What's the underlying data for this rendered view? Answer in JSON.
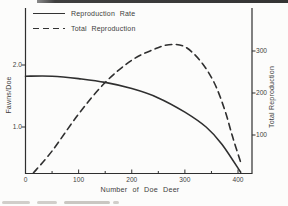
{
  "figure": {
    "ink_color": "#2f2f2f",
    "paper_color": "#fcfcfb"
  },
  "chart_data": {
    "type": "line",
    "title": "",
    "xlabel": "Number of Doe Deer",
    "x_ticks": [
      0,
      100,
      200,
      300,
      400
    ],
    "x_minor_ticks": [
      50,
      150,
      250,
      350
    ],
    "x_range": [
      0,
      427
    ],
    "grid": "off",
    "axes": {
      "left": {
        "label": "Fawns/Doe",
        "tick_labels": [
          "2.0",
          "1.0"
        ],
        "tick_values": [
          2.0,
          1.0
        ]
      },
      "right": {
        "label": "Total Reproduction",
        "tick_labels": [
          "300",
          "200",
          "100"
        ],
        "tick_values": [
          300,
          200,
          100
        ]
      }
    },
    "series": [
      {
        "name": "Reproduction Rate",
        "axis": "left",
        "line_style": "solid",
        "points": [
          [
            0,
            1.82
          ],
          [
            50,
            1.82
          ],
          [
            100,
            1.78
          ],
          [
            150,
            1.72
          ],
          [
            200,
            1.62
          ],
          [
            250,
            1.47
          ],
          [
            300,
            1.24
          ],
          [
            340,
            1.0
          ],
          [
            370,
            0.72
          ],
          [
            405,
            0.27
          ]
        ]
      },
      {
        "name": "Total Reproduction",
        "axis": "right",
        "line_style": "dashed",
        "points": [
          [
            15,
            10
          ],
          [
            50,
            62
          ],
          [
            100,
            150
          ],
          [
            150,
            225
          ],
          [
            200,
            278
          ],
          [
            240,
            303
          ],
          [
            270,
            315
          ],
          [
            300,
            310
          ],
          [
            330,
            275
          ],
          [
            355,
            225
          ],
          [
            375,
            160
          ],
          [
            390,
            95
          ],
          [
            405,
            35
          ]
        ]
      }
    ],
    "legend": {
      "position": "top-left",
      "entries": [
        {
          "label": "Reproduction Rate",
          "line_style": "solid"
        },
        {
          "label": "Total Reproduction",
          "line_style": "dashed"
        }
      ]
    }
  }
}
